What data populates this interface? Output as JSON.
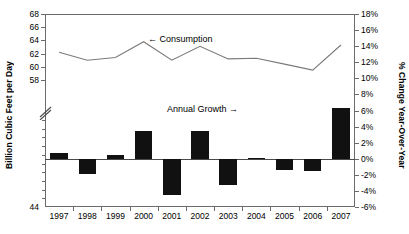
{
  "chart_data": {
    "type": "bar",
    "title": "",
    "categories": [
      "1997",
      "1998",
      "1999",
      "2000",
      "2001",
      "2002",
      "2003",
      "2004",
      "2005",
      "2006",
      "2007"
    ],
    "series": [
      {
        "name": "Consumption",
        "type": "line",
        "axis": "left",
        "values": [
          62.2,
          61.0,
          61.4,
          63.8,
          61.0,
          63.1,
          61.2,
          61.3,
          60.4,
          59.5,
          63.3
        ]
      },
      {
        "name": "Annual Growth",
        "type": "bar",
        "axis": "right",
        "values": [
          0.7,
          -1.9,
          0.5,
          3.5,
          -4.5,
          3.4,
          -3.3,
          0.1,
          -1.4,
          -1.5,
          6.3
        ]
      }
    ],
    "xlabel": "",
    "ylabel_left": "Billion Cubic Feet per Day",
    "ylabel_right": "% Change Year-Over-Year",
    "ylim_left": [
      44,
      68
    ],
    "ylim_right": [
      -6,
      18
    ],
    "left_axis_break": true,
    "left_axis_break_between": [
      44,
      58
    ],
    "grid": false,
    "legend": "inline-annotations",
    "annotations": [
      {
        "text": "←  Consumption",
        "series": "Consumption"
      },
      {
        "text": "Annual Growth  →",
        "series": "Annual Growth"
      }
    ]
  },
  "axes": {
    "left": {
      "label": "Billion Cubic Feet per Day",
      "ticks": [
        "68",
        "66",
        "64",
        "62",
        "60",
        "58",
        "44"
      ]
    },
    "right": {
      "label": "% Change Year-Over-Year",
      "ticks": [
        "18%",
        "16%",
        "14%",
        "12%",
        "10%",
        "8%",
        "6%",
        "4%",
        "2%",
        "0%",
        "-2%",
        "-4%",
        "-6%"
      ]
    },
    "bottom": {
      "ticks": [
        "1997",
        "1998",
        "1999",
        "2000",
        "2001",
        "2002",
        "2003",
        "2004",
        "2005",
        "2006",
        "2007"
      ]
    }
  },
  "annotations": {
    "consumption": "←  Consumption",
    "annual_growth": "Annual Growth  →"
  },
  "colors": {
    "bar": "#111111",
    "line": "#7a7a7a",
    "axis": "#6b6b6b",
    "background": "#ffffff"
  }
}
